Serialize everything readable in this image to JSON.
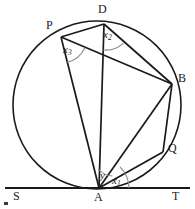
{
  "figure": {
    "background_color": "#ffffff",
    "stroke_color": "#1a1a1a"
  },
  "points": {
    "P": {
      "label": "P",
      "x": 61,
      "y": 37,
      "label_x": 46,
      "label_y": 19
    },
    "D": {
      "label": "D",
      "x": 104,
      "y": 24,
      "label_x": 98,
      "label_y": 3
    },
    "B": {
      "label": "B",
      "x": 172,
      "y": 84,
      "label_x": 178,
      "label_y": 72
    },
    "Q": {
      "label": "Q",
      "x": 163,
      "y": 152,
      "label_x": 168,
      "label_y": 142
    },
    "A": {
      "label": "A",
      "x": 99,
      "y": 188,
      "label_x": 94,
      "label_y": 191
    },
    "S": {
      "label": "S",
      "x": 12,
      "y": 188,
      "label_x": 13,
      "label_y": 190
    },
    "T": {
      "label": "T",
      "x": 183,
      "y": 188,
      "label_x": 172,
      "label_y": 190
    }
  },
  "circle": {
    "center_x": 97,
    "center_y": 105,
    "radius": 84
  },
  "tangent_line": {
    "name": "ST",
    "x1": 5,
    "y1": 188,
    "x2": 190,
    "y2": 188
  },
  "chords": [
    {
      "name": "PD",
      "from": "P",
      "to": "D"
    },
    {
      "name": "PB",
      "from": "P",
      "to": "B"
    },
    {
      "name": "PA",
      "from": "P",
      "to": "A"
    },
    {
      "name": "DB",
      "from": "D",
      "to": "B"
    },
    {
      "name": "DA",
      "from": "D",
      "to": "A"
    },
    {
      "name": "AB",
      "from": "A",
      "to": "B"
    },
    {
      "name": "AQ",
      "from": "A",
      "to": "Q"
    },
    {
      "name": "BQ",
      "from": "B",
      "to": "Q"
    }
  ],
  "angles": [
    {
      "id": "x1",
      "label": "x",
      "subscript": "1",
      "vertex": "A",
      "description": "angle between AQ and tangent AT",
      "label_x": 112,
      "label_y": 175,
      "arc_radius": 30
    },
    {
      "id": "x2",
      "label": "x",
      "subscript": "2",
      "vertex": "D",
      "description": "angle ADB between DA and DB",
      "label_x": 103,
      "label_y": 29,
      "arc_radius": 26
    },
    {
      "id": "x3",
      "label": "x",
      "subscript": "3",
      "vertex": "P",
      "description": "angle APB between PA and PB",
      "label_x": 63,
      "label_y": 44,
      "arc_radius": 26
    },
    {
      "id": "y",
      "label": "y",
      "subscript": "",
      "vertex": "A",
      "description": "angle between AD and AQ",
      "label_x": 100,
      "label_y": 170,
      "arc_radius": 19
    }
  ]
}
